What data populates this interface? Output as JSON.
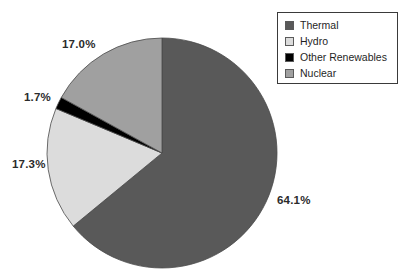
{
  "chart_data": {
    "type": "pie",
    "title": "",
    "categories": [
      "Thermal",
      "Hydro",
      "Other Renewables",
      "Nuclear"
    ],
    "values": [
      64.1,
      17.3,
      1.7,
      17.0
    ],
    "value_labels": [
      "64.1%",
      "17.3%",
      "1.7%",
      "17.0%"
    ],
    "colors": [
      "#595959",
      "#dcdcdc",
      "#000000",
      "#a0a0a0"
    ],
    "units": "percent",
    "start_angle_deg": 0,
    "direction": "clockwise",
    "legend_position": "top-right",
    "grid": false
  },
  "legend": {
    "items": [
      {
        "label": "Thermal",
        "color": "#595959"
      },
      {
        "label": "Hydro",
        "color": "#dcdcdc"
      },
      {
        "label": "Other Renewables",
        "color": "#000000"
      },
      {
        "label": "Nuclear",
        "color": "#a0a0a0"
      }
    ]
  },
  "labels": {
    "thermal": "64.1%",
    "hydro": "17.3%",
    "other_renewables": "1.7%",
    "nuclear": "17.0%"
  },
  "geometry": {
    "center_x": 162,
    "center_y": 153,
    "radius": 115
  }
}
